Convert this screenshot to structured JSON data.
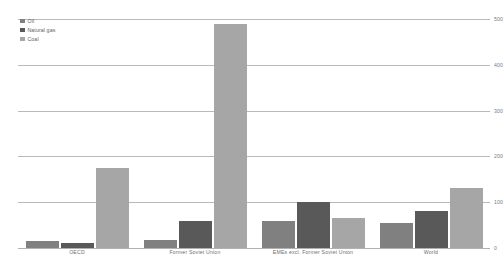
{
  "chart_data": {
    "type": "bar",
    "title": "",
    "xlabel": "",
    "ylabel": "",
    "ylim": [
      0,
      500
    ],
    "yticks": [
      0,
      100,
      200,
      300,
      400,
      500
    ],
    "grid": true,
    "legend_position": "top-left",
    "categories": [
      "OECD",
      "Former Soviet Union",
      "EMEs excl. Former Soviet Union",
      "World"
    ],
    "series": [
      {
        "name": "Oil",
        "color": "#808080",
        "values": [
          16,
          18,
          60,
          55
        ]
      },
      {
        "name": "Natural gas",
        "color": "#595959",
        "values": [
          10,
          60,
          100,
          80
        ]
      },
      {
        "name": "Coal",
        "color": "#a6a6a6",
        "values": [
          175,
          490,
          65,
          130
        ]
      }
    ]
  }
}
